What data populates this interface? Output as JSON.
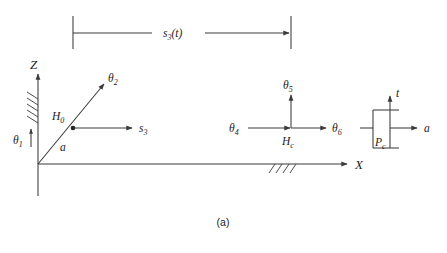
{
  "figure": {
    "caption": "(a)",
    "dimension": {
      "label_base": "s",
      "label_sub": "3",
      "label_arg": "(t)",
      "full_label": "s3(t)"
    },
    "axes": {
      "vertical_label": "Z",
      "horizontal_label": "X"
    },
    "joints": [
      {
        "name": "theta1",
        "base": "θ",
        "sub": "1",
        "kind": "revolute-vertical"
      },
      {
        "name": "theta2",
        "base": "θ",
        "sub": "2",
        "kind": "revolute-diagonal"
      },
      {
        "name": "theta4",
        "base": "θ",
        "sub": "4",
        "kind": "revolute-horizontal"
      },
      {
        "name": "theta5",
        "base": "θ",
        "sub": "5",
        "kind": "revolute-vertical"
      },
      {
        "name": "theta6",
        "base": "θ",
        "sub": "6",
        "kind": "revolute-horizontal"
      }
    ],
    "links": [
      {
        "name": "prismatic-s3",
        "base": "s",
        "sub": "3"
      },
      {
        "name": "link-a",
        "base": "a",
        "sub": ""
      }
    ],
    "points": [
      {
        "name": "H0",
        "base": "H",
        "sub": "0"
      },
      {
        "name": "Hc",
        "base": "H",
        "sub": "c"
      },
      {
        "name": "Pc",
        "base": "P",
        "sub": "c"
      }
    ],
    "tool_frame": {
      "t_label": "t",
      "a_label": "a"
    },
    "colors": {
      "stroke": "#3a3a3a",
      "text": "#1c1c1c",
      "background": "#ffffff"
    }
  }
}
